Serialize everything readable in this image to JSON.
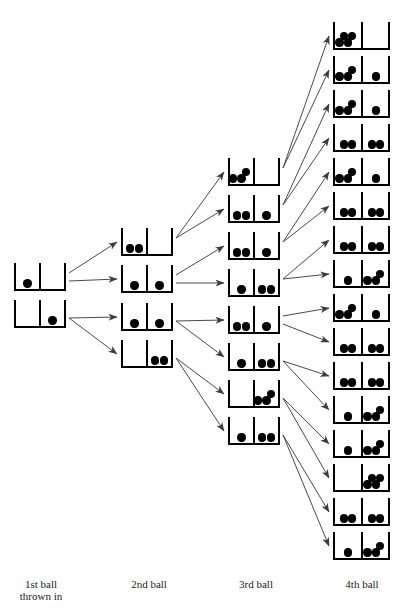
{
  "diagram": {
    "ball_color": "#000000",
    "box_color": "#000000",
    "arrow_color": "#4a4a4a",
    "labels": [
      {
        "id": "label-1st",
        "text": "1st ball\nthrown in",
        "x": 41,
        "y": 578
      },
      {
        "id": "label-2nd",
        "text": "2nd ball",
        "x": 149,
        "y": 578
      },
      {
        "id": "label-3rd",
        "text": "3rd ball",
        "x": 256,
        "y": 578
      },
      {
        "id": "label-4th",
        "text": "4th ball",
        "x": 362,
        "y": 578
      }
    ],
    "columns": [
      {
        "name": "1st ball thrown in",
        "index": 0,
        "x": 14,
        "width": 52,
        "height": 28,
        "boxes": [
          {
            "id": "c1b1",
            "y": 263,
            "left": 1,
            "right": 0,
            "label": "(1,0)"
          },
          {
            "id": "c1b2",
            "y": 300,
            "left": 0,
            "right": 1,
            "label": "(0,1)"
          }
        ]
      },
      {
        "name": "2nd ball",
        "index": 1,
        "x": 121,
        "width": 52,
        "height": 28,
        "boxes": [
          {
            "id": "c2b1",
            "y": 228,
            "left": 2,
            "right": 0,
            "label": "(2,0)"
          },
          {
            "id": "c2b2",
            "y": 265,
            "left": 1,
            "right": 1,
            "label": "(1,1)"
          },
          {
            "id": "c2b3",
            "y": 303,
            "left": 1,
            "right": 1,
            "label": "(1,1)"
          },
          {
            "id": "c2b4",
            "y": 340,
            "left": 0,
            "right": 2,
            "label": "(0,2)"
          }
        ]
      },
      {
        "name": "3rd ball",
        "index": 2,
        "x": 228,
        "width": 52,
        "height": 28,
        "boxes": [
          {
            "id": "c3b1",
            "y": 158,
            "left": 3,
            "right": 0,
            "label": "(3,0)"
          },
          {
            "id": "c3b2",
            "y": 195,
            "left": 2,
            "right": 1,
            "label": "(2,1)"
          },
          {
            "id": "c3b3",
            "y": 232,
            "left": 2,
            "right": 1,
            "label": "(2,1)"
          },
          {
            "id": "c3b4",
            "y": 269,
            "left": 1,
            "right": 2,
            "label": "(1,2)"
          },
          {
            "id": "c3b5",
            "y": 306,
            "left": 2,
            "right": 1,
            "label": "(2,1)"
          },
          {
            "id": "c3b6",
            "y": 343,
            "left": 1,
            "right": 2,
            "label": "(1,2)"
          },
          {
            "id": "c3b7",
            "y": 380,
            "left": 0,
            "right": 3,
            "label": "(0,3)"
          },
          {
            "id": "c3b8",
            "y": 417,
            "left": 1,
            "right": 2,
            "label": "(1,2)"
          }
        ]
      },
      {
        "name": "4th ball",
        "index": 3,
        "x": 333,
        "width": 57,
        "height": 28,
        "boxes": [
          {
            "id": "c4b1",
            "y": 22,
            "left": 4,
            "right": 0,
            "label": "(4,0)"
          },
          {
            "id": "c4b2",
            "y": 56,
            "left": 3,
            "right": 1,
            "label": "(3,1)"
          },
          {
            "id": "c4b3",
            "y": 90,
            "left": 3,
            "right": 1,
            "label": "(3,1)"
          },
          {
            "id": "c4b4",
            "y": 124,
            "left": 2,
            "right": 2,
            "label": "(2,2)"
          },
          {
            "id": "c4b5",
            "y": 158,
            "left": 3,
            "right": 1,
            "label": "(3,1)"
          },
          {
            "id": "c4b6",
            "y": 192,
            "left": 2,
            "right": 2,
            "label": "(2,2)"
          },
          {
            "id": "c4b7",
            "y": 226,
            "left": 2,
            "right": 2,
            "label": "(2,2)"
          },
          {
            "id": "c4b8",
            "y": 260,
            "left": 1,
            "right": 3,
            "label": "(1,3)"
          },
          {
            "id": "c4b9",
            "y": 294,
            "left": 3,
            "right": 1,
            "label": "(3,1)"
          },
          {
            "id": "c4b10",
            "y": 328,
            "left": 2,
            "right": 2,
            "label": "(2,2)"
          },
          {
            "id": "c4b11",
            "y": 362,
            "left": 2,
            "right": 2,
            "label": "(2,2)"
          },
          {
            "id": "c4b12",
            "y": 396,
            "left": 1,
            "right": 3,
            "label": "(1,3)"
          },
          {
            "id": "c4b13",
            "y": 430,
            "left": 1,
            "right": 3,
            "label": "(1,3)"
          },
          {
            "id": "c4b14",
            "y": 464,
            "left": 0,
            "right": 4,
            "label": "(0,4)"
          },
          {
            "id": "c4b15",
            "y": 498,
            "left": 2,
            "right": 2,
            "label": "(2,2)"
          },
          {
            "id": "c4b16",
            "y": 532,
            "left": 1,
            "right": 3,
            "label": "(1,3)"
          }
        ]
      }
    ],
    "arrows": [
      {
        "from": "c1b1",
        "to": "c2b1"
      },
      {
        "from": "c1b1",
        "to": "c2b2"
      },
      {
        "from": "c1b2",
        "to": "c2b3"
      },
      {
        "from": "c1b2",
        "to": "c2b4"
      },
      {
        "from": "c2b1",
        "to": "c3b1"
      },
      {
        "from": "c2b1",
        "to": "c3b2"
      },
      {
        "from": "c2b2",
        "to": "c3b3"
      },
      {
        "from": "c2b2",
        "to": "c3b4"
      },
      {
        "from": "c2b3",
        "to": "c3b5"
      },
      {
        "from": "c2b3",
        "to": "c3b6"
      },
      {
        "from": "c2b4",
        "to": "c3b7"
      },
      {
        "from": "c2b4",
        "to": "c3b8"
      },
      {
        "from": "c3b1",
        "to": "c4b1"
      },
      {
        "from": "c3b1",
        "to": "c4b2"
      },
      {
        "from": "c3b2",
        "to": "c4b3"
      },
      {
        "from": "c3b2",
        "to": "c4b4"
      },
      {
        "from": "c3b3",
        "to": "c4b5"
      },
      {
        "from": "c3b3",
        "to": "c4b6"
      },
      {
        "from": "c3b4",
        "to": "c4b7"
      },
      {
        "from": "c3b4",
        "to": "c4b8"
      },
      {
        "from": "c3b5",
        "to": "c4b9"
      },
      {
        "from": "c3b5",
        "to": "c4b10"
      },
      {
        "from": "c3b6",
        "to": "c4b11"
      },
      {
        "from": "c3b6",
        "to": "c4b12"
      },
      {
        "from": "c3b7",
        "to": "c4b13"
      },
      {
        "from": "c3b7",
        "to": "c4b14"
      },
      {
        "from": "c3b8",
        "to": "c4b15"
      },
      {
        "from": "c3b8",
        "to": "c4b16"
      }
    ]
  }
}
